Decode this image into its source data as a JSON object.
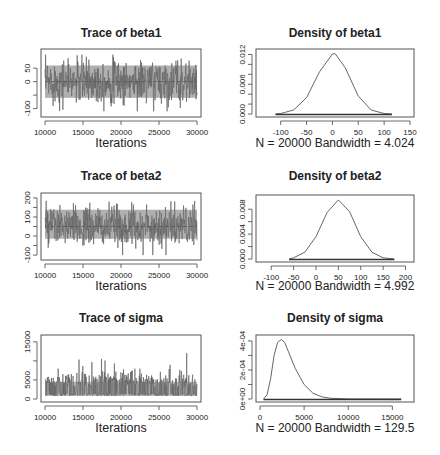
{
  "chart_data": [
    {
      "type": "line",
      "title": "Trace of beta1",
      "xlabel": "Iterations",
      "ylabel": "",
      "xlim": [
        10000,
        30000
      ],
      "ylim": [
        -120,
        110
      ],
      "xticks": [
        10000,
        15000,
        20000,
        25000,
        30000
      ],
      "yticks": [
        -100,
        -50,
        0,
        50
      ],
      "ytick_labels": [
        "-100",
        "",
        "0",
        "50"
      ],
      "series": [
        {
          "name": "beta1 chain",
          "mean": 0,
          "lower_band": -75,
          "upper_band": 75,
          "min": -110,
          "max": 100
        }
      ],
      "grid": false
    },
    {
      "type": "line",
      "title": "Density of beta1",
      "xlabel": "N = 20000   Bandwidth = 4.024",
      "ylabel": "",
      "xlim": [
        -140,
        150
      ],
      "ylim": [
        0,
        0.0125
      ],
      "xticks": [
        -100,
        -50,
        0,
        50,
        100,
        150
      ],
      "yticks": [
        0.0,
        0.002,
        0.004,
        0.006,
        0.008,
        0.01,
        0.012
      ],
      "ytick_labels": [
        "0.000",
        "",
        "",
        "0.006",
        "",
        "",
        "0.012"
      ],
      "series": [
        {
          "name": "density",
          "x": [
            -110,
            -100,
            -75,
            -50,
            -25,
            0,
            5,
            25,
            50,
            75,
            100,
            115
          ],
          "values": [
            0.0,
            0.0001,
            0.0008,
            0.0033,
            0.0085,
            0.0121,
            0.0122,
            0.0093,
            0.0036,
            0.0008,
            0.0001,
            0.0
          ]
        }
      ],
      "grid": false
    },
    {
      "type": "line",
      "title": "Trace of beta2",
      "xlabel": "Iterations",
      "ylabel": "",
      "xlim": [
        10000,
        30000
      ],
      "ylim": [
        -110,
        210
      ],
      "xticks": [
        10000,
        15000,
        20000,
        25000,
        30000
      ],
      "yticks": [
        -100,
        -50,
        0,
        50,
        100,
        150,
        200
      ],
      "ytick_labels": [
        "-100",
        "",
        "0",
        "",
        "100",
        "",
        "200"
      ],
      "series": [
        {
          "name": "beta2 chain",
          "mean": 50,
          "lower_band": -30,
          "upper_band": 160,
          "min": -100,
          "max": 185
        }
      ],
      "grid": false
    },
    {
      "type": "line",
      "title": "Density of beta2",
      "xlabel": "N = 20000   Bandwidth = 4.992",
      "ylabel": "",
      "xlim": [
        -125,
        210
      ],
      "ylim": [
        0,
        0.0098
      ],
      "xticks": [
        -100,
        -50,
        0,
        50,
        100,
        150,
        200
      ],
      "yticks": [
        0.0,
        0.002,
        0.004,
        0.006,
        0.008
      ],
      "ytick_labels": [
        "0.000",
        "",
        "0.004",
        "",
        "0.008"
      ],
      "series": [
        {
          "name": "density",
          "x": [
            -60,
            -50,
            -25,
            0,
            25,
            50,
            75,
            100,
            125,
            150,
            175
          ],
          "values": [
            0.0,
            0.0002,
            0.0011,
            0.0036,
            0.0075,
            0.0095,
            0.0076,
            0.0036,
            0.0011,
            0.0002,
            0.0
          ]
        }
      ],
      "grid": false
    },
    {
      "type": "line",
      "title": "Trace of sigma",
      "xlabel": "Iterations",
      "ylabel": "",
      "xlim": [
        10000,
        30000
      ],
      "ylim": [
        0,
        16000
      ],
      "xticks": [
        10000,
        15000,
        20000,
        25000,
        30000
      ],
      "yticks": [
        0,
        5000,
        10000,
        15000
      ],
      "ytick_labels": [
        "0",
        "5000",
        "",
        "15000"
      ],
      "series": [
        {
          "name": "sigma chain",
          "baseline": 2500,
          "lower_band": 800,
          "upper_band": 7000,
          "max": 15500
        }
      ],
      "grid": false
    },
    {
      "type": "line",
      "title": "Density of sigma",
      "xlabel": "N = 20000   Bandwidth = 129.5",
      "ylabel": "",
      "xlim": [
        0,
        17000
      ],
      "ylim": [
        0,
        0.00042
      ],
      "xticks": [
        0,
        5000,
        10000,
        15000
      ],
      "yticks": [
        0,
        0.0001,
        0.0002,
        0.0003,
        0.0004
      ],
      "ytick_labels": [
        "0e+00",
        "",
        "2e-04",
        "",
        "4e-04"
      ],
      "series": [
        {
          "name": "density",
          "x": [
            400,
            800,
            1200,
            1600,
            2000,
            2400,
            2800,
            3200,
            4000,
            5000,
            6000,
            7000,
            8000,
            10000,
            16000
          ],
          "values": [
            0.0,
            3e-05,
            0.00014,
            0.0003,
            0.00039,
            0.00041,
            0.00039,
            0.00033,
            0.00021,
            0.0001,
            4e-05,
            1.5e-05,
            5e-06,
            1e-06,
            0.0
          ]
        }
      ],
      "grid": false
    }
  ],
  "panels": [
    {
      "title": "Trace of beta1",
      "xlabel": "Iterations"
    },
    {
      "title": "Density of beta1",
      "xlabel": "N = 20000   Bandwidth = 4.024"
    },
    {
      "title": "Trace of beta2",
      "xlabel": "Iterations"
    },
    {
      "title": "Density of beta2",
      "xlabel": "N = 20000   Bandwidth = 4.992"
    },
    {
      "title": "Trace of sigma",
      "xlabel": "Iterations"
    },
    {
      "title": "Density of sigma",
      "xlabel": "N = 20000   Bandwidth = 129.5"
    }
  ],
  "colors": {
    "frame": "#555555",
    "trace": "#5a5a5a",
    "curve": "#666666",
    "text": "#222222"
  }
}
